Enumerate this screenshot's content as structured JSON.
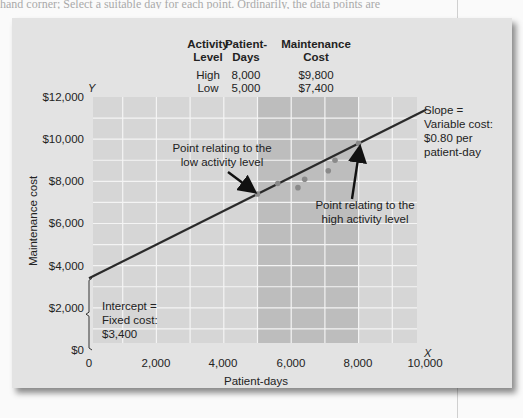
{
  "page": {
    "top_text_fragment": "hand corner; Select a suitable day for each point. Ordinarily, the data points are"
  },
  "summary_table": {
    "headers": [
      [
        "Activity",
        "Level"
      ],
      [
        "Patient-",
        "Days"
      ],
      [
        "Maintenance",
        "Cost"
      ]
    ],
    "rows": [
      {
        "level": "High",
        "days": "8,000",
        "cost": "$9,800"
      },
      {
        "level": "Low",
        "days": "5,000",
        "cost": "$7,400"
      }
    ]
  },
  "axes": {
    "y_letter": "Y",
    "x_letter": "X",
    "y_title": "Maintenance cost",
    "x_title": "Patient-days",
    "y_ticks": [
      "$0",
      "$2,000",
      "$4,000",
      "$6,000",
      "$8,000",
      "$10,000",
      "$12,000"
    ],
    "x_ticks": [
      "0",
      "2,000",
      "4,000",
      "6,000",
      "8,000",
      "10,000"
    ]
  },
  "annotations": {
    "low_point": [
      "Point relating to the",
      "low activity level"
    ],
    "high_point": [
      "Point relating to the",
      "high activity level"
    ],
    "slope": [
      "Slope =",
      "Variable cost:",
      "$0.80 per",
      "patient-day"
    ],
    "intercept": [
      "Intercept =",
      "Fixed cost:",
      "$3,400"
    ]
  },
  "colors": {
    "plot_bg": "#d6d6d6",
    "band_bg": "#bdbdbd",
    "grid": "#f4f4f4",
    "line": "#2a2a2a",
    "point": "#8a8a8a"
  },
  "chart_data": {
    "type": "scatter",
    "xlabel": "Patient-days",
    "ylabel": "Maintenance cost",
    "xlim": [
      0,
      10000
    ],
    "ylim": [
      0,
      12000
    ],
    "grid": true,
    "x_ticks": [
      0,
      2000,
      4000,
      6000,
      8000,
      10000
    ],
    "y_ticks": [
      0,
      2000,
      4000,
      6000,
      8000,
      10000,
      12000
    ],
    "highlight_band_x": [
      5000,
      8000
    ],
    "points": [
      {
        "x": 5000,
        "y": 7400,
        "label": "Low activity level"
      },
      {
        "x": 5600,
        "y": 7900
      },
      {
        "x": 6200,
        "y": 7700
      },
      {
        "x": 6400,
        "y": 8100
      },
      {
        "x": 7100,
        "y": 8500
      },
      {
        "x": 7300,
        "y": 9000
      },
      {
        "x": 8000,
        "y": 9800,
        "label": "High activity level"
      }
    ],
    "fit_line": {
      "intercept": 3400,
      "slope": 0.8,
      "x_range": [
        0,
        10000
      ]
    },
    "table": {
      "columns": [
        "Activity Level",
        "Patient-Days",
        "Maintenance Cost"
      ],
      "rows": [
        [
          "High",
          8000,
          9800
        ],
        [
          "Low",
          5000,
          7400
        ]
      ]
    }
  }
}
